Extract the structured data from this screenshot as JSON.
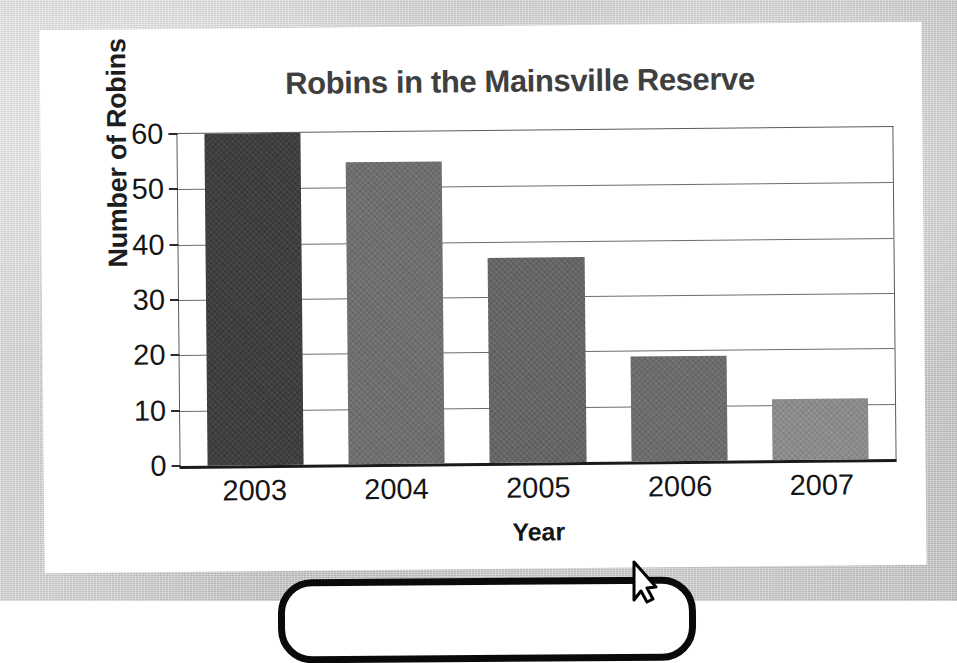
{
  "chart_data": {
    "type": "bar",
    "title": "Robins in the Mainsville Reserve",
    "xlabel": "Year",
    "ylabel": "Number of Robins",
    "categories": [
      "2003",
      "2004",
      "2005",
      "2006",
      "2007"
    ],
    "values": [
      60,
      54.5,
      37,
      19,
      11
    ],
    "ylim": [
      0,
      60
    ],
    "yticks": [
      0,
      10,
      20,
      30,
      40,
      50,
      60
    ],
    "ytick_labels": [
      "0",
      "10",
      "20",
      "30",
      "40",
      "50",
      "60"
    ],
    "grid": true,
    "legend": false,
    "bar_colors": [
      "#3a3a3a",
      "#6e6e6e",
      "#646464",
      "#6b6b6b",
      "#8c8c8c"
    ]
  },
  "page": {
    "background_color": "#c9c9c9",
    "card_color": "#ffffff",
    "axis_color": "#1a1a1a",
    "gridline_color": "#6e6e6e",
    "title_color": "#3f3f3f"
  },
  "overlay": {
    "callout_border_color": "#0a0a0a",
    "cursor_fill_color": "#ffffff",
    "cursor_stroke_color": "#000000"
  }
}
